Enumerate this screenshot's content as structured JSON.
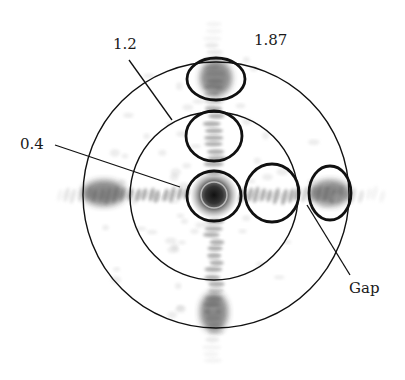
{
  "figure": {
    "type": "diffraction-pattern-diagram",
    "colors": {
      "line": "#111111",
      "speckle_dark": "#2a2a2a",
      "speckle_mid": "#6e6e6e",
      "speckle_light": "#b8b8b8",
      "background": "#ffffff"
    },
    "labels": [
      {
        "id": "label-1-2",
        "text": "1.2",
        "x": 113,
        "y": 37
      },
      {
        "id": "label-1-87",
        "text": "1.87",
        "x": 254,
        "y": 33
      },
      {
        "id": "label-0-4",
        "text": "0.4",
        "x": 20,
        "y": 137
      },
      {
        "id": "label-gap",
        "text": "Gap",
        "x": 349,
        "y": 281
      }
    ],
    "rings": [
      {
        "id": "ring-outer",
        "value": "1.87",
        "cx": 216,
        "cy": 195,
        "r": 133
      },
      {
        "id": "ring-inner",
        "value": "1.2",
        "cx": 214,
        "cy": 196,
        "r": 84
      }
    ],
    "ellipses": [
      {
        "id": "order-top",
        "cx": 216,
        "cy": 79,
        "rx": 29,
        "ry": 21
      },
      {
        "id": "order-upper",
        "cx": 214,
        "cy": 136,
        "rx": 28,
        "ry": 25
      },
      {
        "id": "order-center",
        "cx": 214,
        "cy": 196,
        "rx": 27,
        "ry": 25,
        "value": "0.4"
      },
      {
        "id": "order-right",
        "cx": 272,
        "cy": 193,
        "rx": 27,
        "ry": 29
      },
      {
        "id": "order-far-right",
        "cx": 330,
        "cy": 193,
        "rx": 21,
        "ry": 27
      }
    ],
    "leaders": [
      {
        "id": "leader-1-2",
        "x1": 129,
        "y1": 60,
        "x2": 172,
        "y2": 120
      },
      {
        "id": "leader-0-4",
        "x1": 55,
        "y1": 145,
        "x2": 180,
        "y2": 187
      },
      {
        "id": "leader-gap",
        "x1": 307,
        "y1": 205,
        "x2": 350,
        "y2": 275
      }
    ]
  }
}
